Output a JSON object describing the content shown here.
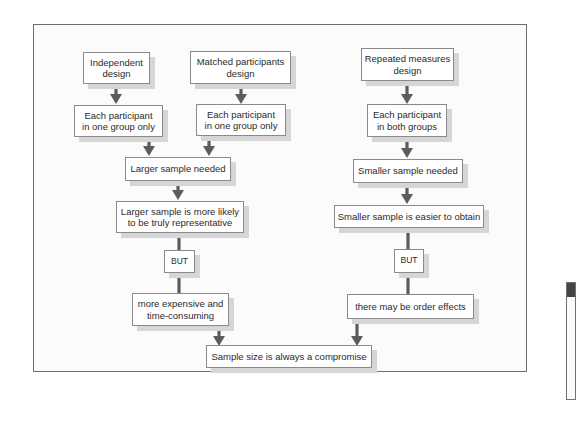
{
  "diagram": {
    "nodes": {
      "independent": "Independent\ndesign",
      "matched": "Matched participants\ndesign",
      "repeated": "Repeated measures\ndesign",
      "one_group_left": "Each participant\nin one group only",
      "one_group_mid": "Each participant\nin one group only",
      "both_groups": "Each participant\nin both groups",
      "larger_needed": "Larger sample needed",
      "smaller_needed": "Smaller sample needed",
      "larger_rep": "Larger sample is more likely\nto be truly representative",
      "smaller_easier": "Smaller sample is easier to obtain",
      "but_left": "BUT",
      "but_right": "BUT",
      "expensive": "more expensive and\ntime-consuming",
      "order_effects": "there may be order effects",
      "compromise": "Sample size is always a compromise"
    },
    "edges": [
      [
        "independent",
        "one_group_left"
      ],
      [
        "matched",
        "one_group_mid"
      ],
      [
        "repeated",
        "both_groups"
      ],
      [
        "one_group_left",
        "larger_needed"
      ],
      [
        "one_group_mid",
        "larger_needed"
      ],
      [
        "both_groups",
        "smaller_needed"
      ],
      [
        "larger_needed",
        "larger_rep"
      ],
      [
        "smaller_needed",
        "smaller_easier"
      ],
      [
        "larger_rep",
        "but_left"
      ],
      [
        "but_left",
        "expensive"
      ],
      [
        "smaller_easier",
        "but_right"
      ],
      [
        "but_right",
        "order_effects"
      ],
      [
        "expensive",
        "compromise"
      ],
      [
        "order_effects",
        "compromise"
      ]
    ]
  }
}
